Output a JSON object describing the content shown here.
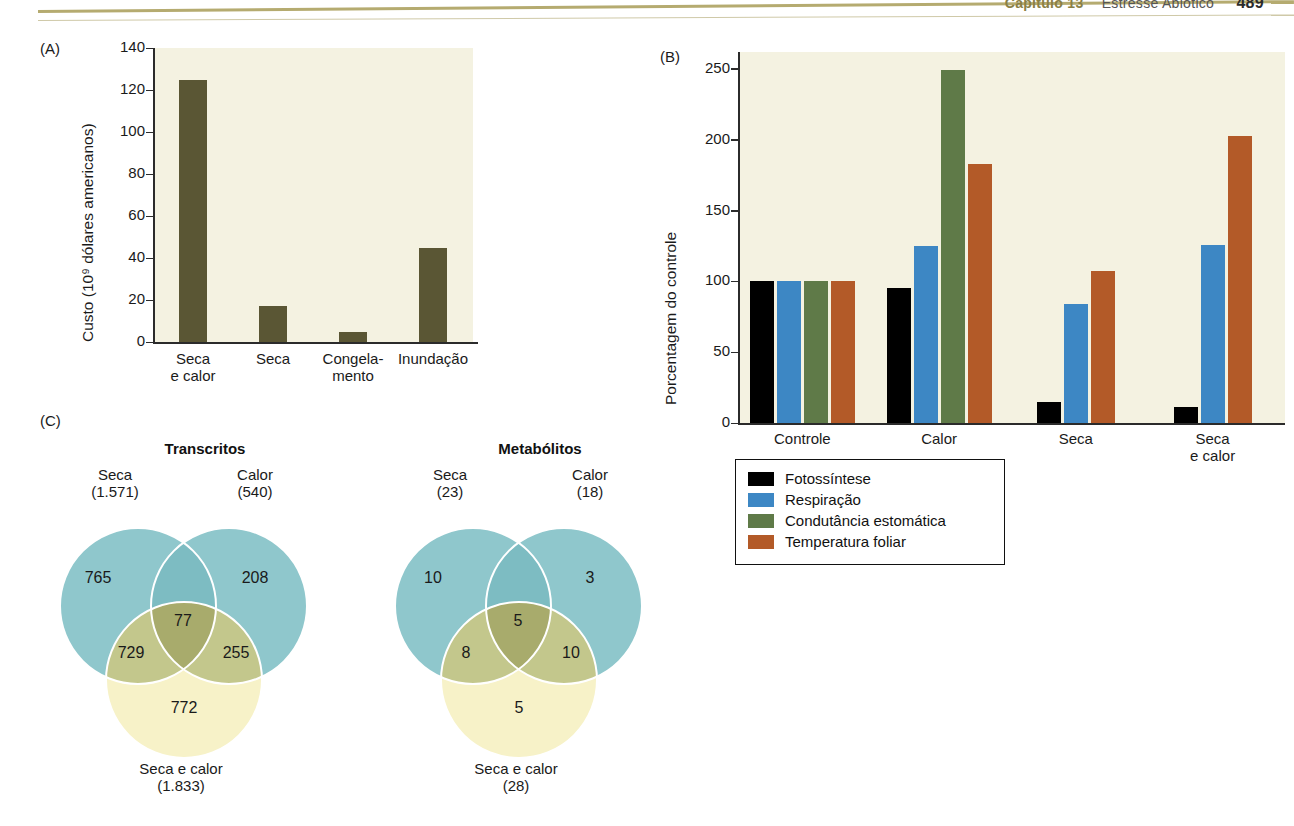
{
  "header": {
    "chapter": "Capítulo 13",
    "title": "Estresse Abiótico",
    "page": "489"
  },
  "panels": {
    "a_letter": "(A)",
    "b_letter": "(B)",
    "c_letter": "(C)"
  },
  "chart_data": [
    {
      "id": "panel-a",
      "type": "bar",
      "title": "",
      "panel_label": "(A)",
      "xlabel": "",
      "ylabel": "Custo (10⁹ dólares americanos)",
      "ylim": [
        0,
        140
      ],
      "yticks": [
        0,
        20,
        40,
        60,
        80,
        100,
        120,
        140
      ],
      "ytick_labels": [
        "0",
        "20",
        "40",
        "60",
        "80",
        "100",
        "120",
        "140"
      ],
      "grid": false,
      "categories": [
        "Seca e calor",
        "Seca",
        "Congela-mento",
        "Inundação"
      ],
      "category_lines": [
        [
          "Seca",
          "e calor"
        ],
        [
          "Seca",
          ""
        ],
        [
          "Congela-",
          "mento"
        ],
        [
          "Inundação",
          ""
        ]
      ],
      "values": [
        125,
        17,
        5,
        45
      ],
      "bar_color": "#5a5634",
      "plot_bg": "#f4f2e1"
    },
    {
      "id": "panel-b",
      "type": "bar",
      "title": "",
      "panel_label": "(B)",
      "xlabel": "",
      "ylabel": "Porcentagem do controle",
      "ylim": [
        0,
        262
      ],
      "yticks": [
        0,
        50,
        100,
        150,
        200,
        250
      ],
      "ytick_labels": [
        "0",
        "50",
        "100",
        "150",
        "200",
        "250"
      ],
      "grid": false,
      "categories": [
        "Controle",
        "Calor",
        "Seca",
        "Seca e calor"
      ],
      "category_lines": [
        [
          "Controle",
          ""
        ],
        [
          "Calor",
          ""
        ],
        [
          "Seca",
          ""
        ],
        [
          "Seca",
          "e calor"
        ]
      ],
      "legend_position": "below-left",
      "plot_bg": "#f4f2e1",
      "series": [
        {
          "name": "Fotossíntese",
          "color": "#000000",
          "values": [
            100,
            95,
            15,
            11
          ]
        },
        {
          "name": "Respiração",
          "color": "#3d87c4",
          "values": [
            100,
            125,
            84,
            126
          ]
        },
        {
          "name": "Condutância estomática",
          "color": "#5f7a48",
          "values": [
            100,
            249,
            null,
            null
          ]
        },
        {
          "name": "Temperatura foliar",
          "color": "#b35a28",
          "values": [
            100,
            183,
            107,
            203
          ]
        }
      ]
    },
    {
      "id": "panel-c-transcritos",
      "type": "venn",
      "title": "Transcritos",
      "sets": [
        {
          "name": "Seca",
          "total": "(1.571)",
          "only": "765"
        },
        {
          "name": "Calor",
          "total": "(540)",
          "only": "208"
        },
        {
          "name": "Seca e calor",
          "total": "(1.833)",
          "only": "772"
        }
      ],
      "intersections": {
        "seca_secaecalor": "729",
        "calor_secaecalor": "255",
        "all_three": "77"
      },
      "colors": {
        "circle_top": "#8fc7cc",
        "circle_bottom": "#f7f2c8",
        "overlap": "#c3c78c",
        "center": "#a8ab6c"
      }
    },
    {
      "id": "panel-c-metabolitos",
      "type": "venn",
      "title": "Metabólitos",
      "sets": [
        {
          "name": "Seca",
          "total": "(23)",
          "only": "10"
        },
        {
          "name": "Calor",
          "total": "(18)",
          "only": "3"
        },
        {
          "name": "Seca e calor",
          "total": "(28)",
          "only": "5"
        }
      ],
      "intersections": {
        "seca_secaecalor": "8",
        "calor_secaecalor": "10",
        "all_three": "5"
      },
      "colors": {
        "circle_top": "#8fc7cc",
        "circle_bottom": "#f7f2c8",
        "overlap": "#c3c78c",
        "center": "#a8ab6c"
      }
    }
  ],
  "panel_b_legend": {
    "items": [
      {
        "label": "Fotossíntese",
        "color": "#000000"
      },
      {
        "label": "Respiração",
        "color": "#3d87c4"
      },
      {
        "label": "Condutância estomática",
        "color": "#5f7a48"
      },
      {
        "label": "Temperatura foliar",
        "color": "#b35a28"
      }
    ]
  }
}
